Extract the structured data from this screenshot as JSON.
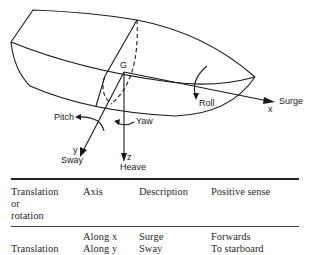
{
  "figure": {
    "labels": {
      "origin": "G",
      "surge": "Surge",
      "x_axis": "x",
      "sway": "Sway",
      "y_axis": "y",
      "heave": "Heave",
      "z_axis": "z",
      "roll": "Roll",
      "pitch": "Pitch",
      "yaw": "Yaw"
    }
  },
  "table": {
    "headers": [
      "Translation or rotation",
      "Axis",
      "Description",
      "Positive sense"
    ],
    "header_lines": {
      "col1": [
        "Translation",
        "or",
        "rotation"
      ]
    },
    "rows": [
      {
        "group": "Translation",
        "axis": "Along x",
        "description": "Surge",
        "positive_sense": "Forwards"
      },
      {
        "group": "",
        "axis": "Along y",
        "description": "Sway",
        "positive_sense": "To starboard"
      }
    ]
  }
}
